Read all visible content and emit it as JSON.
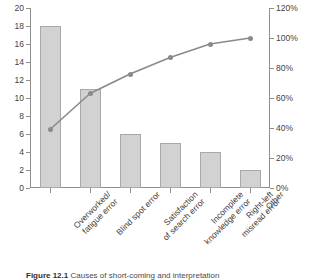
{
  "chart_data": {
    "type": "bar",
    "title": "",
    "subtitle": "",
    "xlabel": "",
    "ylabel": "",
    "categories": [
      "Overworked/\nfatigue error",
      "Blind spot error",
      "Satisfaction\nof search error",
      "Incomplete\nknowledge error",
      "Right-left\nmisread error",
      "Other"
    ],
    "series": [
      {
        "name": "Count",
        "type": "bar",
        "axis": "left",
        "values": [
          18,
          11,
          6,
          5,
          4,
          2
        ]
      },
      {
        "name": "Cumulative percentage",
        "type": "line",
        "axis": "right",
        "values": [
          39,
          63,
          76,
          87,
          96,
          100
        ]
      }
    ],
    "ylim": [
      0,
      20
    ],
    "ylim_right": [
      0,
      120
    ],
    "yticks": [
      0,
      2,
      4,
      6,
      8,
      10,
      12,
      14,
      16,
      18,
      20
    ],
    "yticks_right": [
      "0%",
      "20%",
      "40%",
      "60%",
      "80%",
      "100%",
      "120%"
    ],
    "ytick_labels": [
      "0",
      "2",
      "4",
      "6",
      "8",
      "10",
      "12",
      "14",
      "16",
      "18",
      "20"
    ],
    "grid": false,
    "legend": "none",
    "colors": {
      "bar_fill": "#d2d2d2",
      "bar_edge": "#a8a8a8",
      "line": "#8a8a8a",
      "marker": "#8a8a8a",
      "axis": "#8e8e8e",
      "text": "#3f3f3f"
    }
  },
  "caption": {
    "number": "Figure 12.1",
    "text": "Causes of short-coming and interpretation"
  }
}
